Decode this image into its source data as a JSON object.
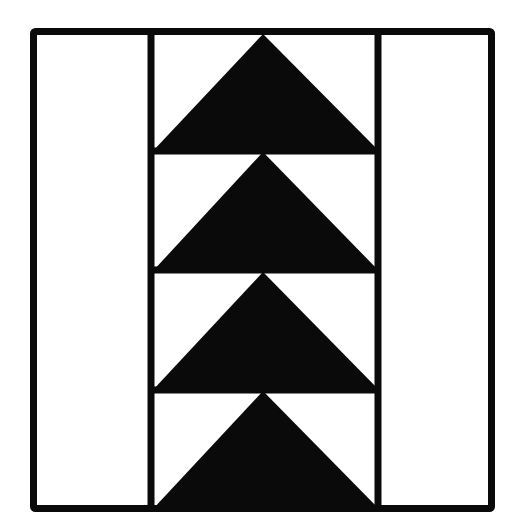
{
  "diagram": {
    "title": "",
    "type": "quilt-block",
    "pattern": "flying-geese-column",
    "colors": {
      "background": "#ffffff",
      "fill": "#0a0a0a",
      "stroke": "#0a0a0a"
    },
    "columns": [
      "left-plain-strip",
      "center-geese-column",
      "right-plain-strip"
    ],
    "geese_count": 4
  }
}
